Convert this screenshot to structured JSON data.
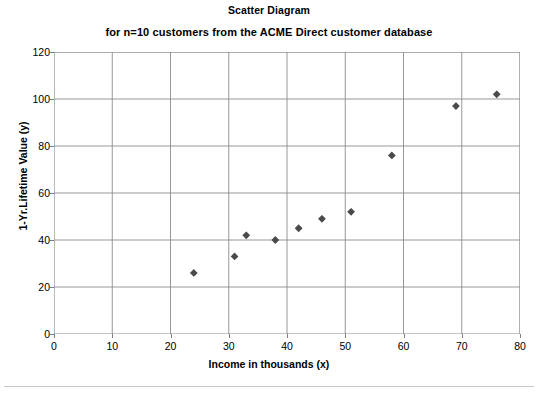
{
  "chart_data": {
    "type": "scatter",
    "title": "Scatter Diagram",
    "subtitle": "for n=10 customers from the ACME Direct customer database",
    "xlabel": "Income in thousands (x)",
    "ylabel": "1-Yr.Lifetime Value (y)",
    "xlim": [
      0,
      80
    ],
    "ylim": [
      0,
      120
    ],
    "xticks": [
      0,
      10,
      20,
      30,
      40,
      50,
      60,
      70,
      80
    ],
    "yticks": [
      0,
      20,
      40,
      60,
      80,
      100,
      120
    ],
    "grid": true,
    "legend": null,
    "marker": "diamond",
    "marker_color": "#4a4a4a",
    "series": [
      {
        "name": "customers",
        "points": [
          {
            "x": 24,
            "y": 26
          },
          {
            "x": 31,
            "y": 33
          },
          {
            "x": 33,
            "y": 42
          },
          {
            "x": 38,
            "y": 40
          },
          {
            "x": 42,
            "y": 45
          },
          {
            "x": 46,
            "y": 49
          },
          {
            "x": 51,
            "y": 52
          },
          {
            "x": 58,
            "y": 76
          },
          {
            "x": 69,
            "y": 97
          },
          {
            "x": 76,
            "y": 102
          }
        ]
      }
    ]
  },
  "colors": {
    "axis": "#7d7d7d",
    "grid": "#8c8c8c",
    "marker": "#4a4a4a",
    "text": "#000000",
    "background": "#ffffff"
  }
}
